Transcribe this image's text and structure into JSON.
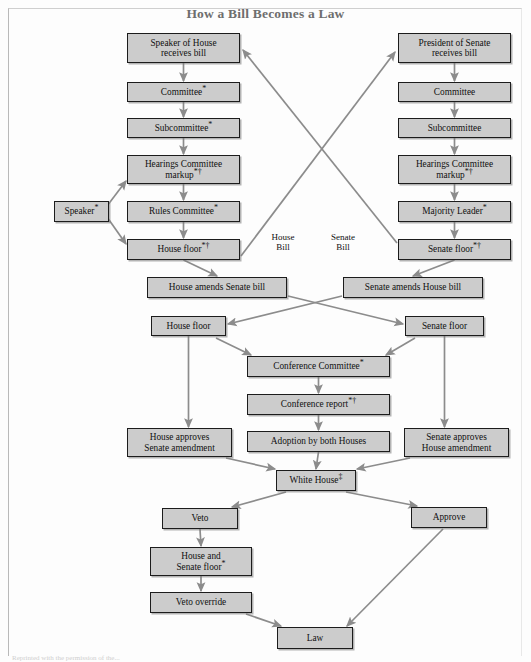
{
  "page": {
    "title": "How a Bill Becomes a Law",
    "footnote": "Reprinted with the permission of the..."
  },
  "chart_data": {
    "type": "diagram",
    "title": "How a Bill Becomes a Law",
    "subtitle": "",
    "legend": [],
    "annotations": [
      {
        "id": "house-bill-label",
        "text": "House\nBill",
        "x": 283,
        "y": 232
      },
      {
        "id": "senate-bill-label",
        "text": "Senate\nBill",
        "x": 343,
        "y": 232
      }
    ],
    "footnote_symbols": {
      "asterisk": "*",
      "dagger": "†",
      "double_dagger": "‡"
    },
    "nodes": [
      {
        "id": "speaker-of-house",
        "label": "Speaker of House\nreceives bill",
        "x": 127,
        "y": 33,
        "w": 113,
        "h": 30
      },
      {
        "id": "house-committee",
        "label": "Committee*",
        "x": 127,
        "y": 82,
        "w": 113,
        "h": 20
      },
      {
        "id": "house-subcommittee",
        "label": "Subcommittee*",
        "x": 127,
        "y": 118,
        "w": 113,
        "h": 20
      },
      {
        "id": "house-hearings-markup",
        "label": "Hearings Committee\nmarkup*†",
        "x": 127,
        "y": 155,
        "w": 113,
        "h": 29
      },
      {
        "id": "rules-committee",
        "label": "Rules Committee*",
        "x": 127,
        "y": 201,
        "w": 113,
        "h": 21
      },
      {
        "id": "speaker-side",
        "label": "Speaker*",
        "x": 54,
        "y": 201,
        "w": 55,
        "h": 21
      },
      {
        "id": "house-floor-1",
        "label": "House floor*†",
        "x": 127,
        "y": 239,
        "w": 113,
        "h": 21
      },
      {
        "id": "president-of-senate",
        "label": "President of Senate\nreceives bill",
        "x": 398,
        "y": 33,
        "w": 113,
        "h": 30
      },
      {
        "id": "senate-committee",
        "label": "Committee",
        "x": 398,
        "y": 82,
        "w": 113,
        "h": 20
      },
      {
        "id": "senate-subcommittee",
        "label": "Subcommittee",
        "x": 398,
        "y": 118,
        "w": 113,
        "h": 20
      },
      {
        "id": "senate-hearings-markup",
        "label": "Hearings Committee\nmarkup*†",
        "x": 398,
        "y": 155,
        "w": 113,
        "h": 29
      },
      {
        "id": "majority-leader",
        "label": "Majority Leader*",
        "x": 398,
        "y": 201,
        "w": 113,
        "h": 21
      },
      {
        "id": "senate-floor-1",
        "label": "Senate floor*†",
        "x": 398,
        "y": 239,
        "w": 113,
        "h": 21
      },
      {
        "id": "house-amends-senate-bill",
        "label": "House amends Senate bill",
        "x": 147,
        "y": 277,
        "w": 140,
        "h": 21
      },
      {
        "id": "senate-amends-house-bill",
        "label": "Senate amends House bill",
        "x": 343,
        "y": 277,
        "w": 140,
        "h": 21
      },
      {
        "id": "house-floor-2",
        "label": "House floor",
        "x": 151,
        "y": 316,
        "w": 75,
        "h": 20
      },
      {
        "id": "senate-floor-2",
        "label": "Senate floor",
        "x": 405,
        "y": 316,
        "w": 79,
        "h": 20
      },
      {
        "id": "conference-committee",
        "label": "Conference Committee*",
        "x": 247,
        "y": 356,
        "w": 143,
        "h": 21
      },
      {
        "id": "conference-report",
        "label": "Conference report*†",
        "x": 247,
        "y": 394,
        "w": 143,
        "h": 21
      },
      {
        "id": "house-approves-senate-amendment",
        "label": "House approves\nSenate amendment",
        "x": 127,
        "y": 428,
        "w": 105,
        "h": 29
      },
      {
        "id": "adoption-by-both-houses",
        "label": "Adoption by both Houses",
        "x": 247,
        "y": 431,
        "w": 143,
        "h": 21
      },
      {
        "id": "senate-approves-house-amendment",
        "label": "Senate approves\nHouse amendment",
        "x": 404,
        "y": 428,
        "w": 105,
        "h": 29
      },
      {
        "id": "white-house",
        "label": "White House‡",
        "x": 276,
        "y": 470,
        "w": 80,
        "h": 21
      },
      {
        "id": "veto",
        "label": "Veto",
        "x": 162,
        "y": 508,
        "w": 76,
        "h": 21
      },
      {
        "id": "approve",
        "label": "Approve",
        "x": 411,
        "y": 507,
        "w": 76,
        "h": 21
      },
      {
        "id": "house-and-senate-floor",
        "label": "House and\nSenate floor*",
        "x": 150,
        "y": 547,
        "w": 102,
        "h": 29
      },
      {
        "id": "veto-override",
        "label": "Veto override",
        "x": 150,
        "y": 592,
        "w": 102,
        "h": 21
      },
      {
        "id": "law",
        "label": "Law",
        "x": 277,
        "y": 627,
        "w": 76,
        "h": 22
      }
    ],
    "edges": [
      {
        "from": "speaker-of-house",
        "to": "house-committee",
        "type": "straight-down"
      },
      {
        "from": "house-committee",
        "to": "house-subcommittee",
        "type": "straight-down"
      },
      {
        "from": "house-subcommittee",
        "to": "house-hearings-markup",
        "type": "straight-down"
      },
      {
        "from": "house-hearings-markup",
        "to": "rules-committee",
        "type": "straight-down"
      },
      {
        "from": "rules-committee",
        "to": "house-floor-1",
        "type": "straight-down"
      },
      {
        "from": "speaker-side",
        "to": "house-hearings-markup",
        "type": "diagonal-up-right"
      },
      {
        "from": "speaker-side",
        "to": "house-floor-1",
        "type": "diagonal-down-right"
      },
      {
        "from": "house-floor-1",
        "to": "president-of-senate",
        "type": "cross-diagonal",
        "label": "House Bill"
      },
      {
        "from": "president-of-senate",
        "to": "senate-committee",
        "type": "straight-down"
      },
      {
        "from": "senate-committee",
        "to": "senate-subcommittee",
        "type": "straight-down"
      },
      {
        "from": "senate-subcommittee",
        "to": "senate-hearings-markup",
        "type": "straight-down"
      },
      {
        "from": "senate-hearings-markup",
        "to": "majority-leader",
        "type": "straight-down"
      },
      {
        "from": "majority-leader",
        "to": "senate-floor-1",
        "type": "straight-down"
      },
      {
        "from": "senate-floor-1",
        "to": "speaker-of-house",
        "type": "cross-diagonal",
        "label": "Senate Bill"
      },
      {
        "from": "house-floor-1",
        "to": "house-amends-senate-bill",
        "type": "straight-down"
      },
      {
        "from": "senate-floor-1",
        "to": "senate-amends-house-bill",
        "type": "straight-down"
      },
      {
        "from": "house-amends-senate-bill",
        "to": "senate-floor-2",
        "type": "cross-diagonal"
      },
      {
        "from": "senate-amends-house-bill",
        "to": "house-floor-2",
        "type": "cross-diagonal"
      },
      {
        "from": "house-floor-2",
        "to": "conference-committee",
        "type": "diagonal-down-right"
      },
      {
        "from": "senate-floor-2",
        "to": "conference-committee",
        "type": "diagonal-down-left"
      },
      {
        "from": "house-floor-2",
        "to": "house-approves-senate-amendment",
        "type": "straight-down"
      },
      {
        "from": "senate-floor-2",
        "to": "senate-approves-house-amendment",
        "type": "straight-down"
      },
      {
        "from": "conference-committee",
        "to": "conference-report",
        "type": "straight-down"
      },
      {
        "from": "conference-report",
        "to": "adoption-by-both-houses",
        "type": "straight-down"
      },
      {
        "from": "adoption-by-both-houses",
        "to": "white-house",
        "type": "straight-down"
      },
      {
        "from": "house-approves-senate-amendment",
        "to": "white-house",
        "type": "diagonal-down-right"
      },
      {
        "from": "senate-approves-house-amendment",
        "to": "white-house",
        "type": "diagonal-down-left"
      },
      {
        "from": "white-house",
        "to": "veto",
        "type": "diagonal-down-left"
      },
      {
        "from": "white-house",
        "to": "approve",
        "type": "diagonal-down-right"
      },
      {
        "from": "veto",
        "to": "house-and-senate-floor",
        "type": "straight-down"
      },
      {
        "from": "house-and-senate-floor",
        "to": "veto-override",
        "type": "straight-down"
      },
      {
        "from": "veto-override",
        "to": "law",
        "type": "diagonal-down-right"
      },
      {
        "from": "approve",
        "to": "law",
        "type": "diagonal-down-left"
      }
    ],
    "colors": {
      "node_fill": "#cccccc",
      "node_border": "#1c1c1c",
      "arrow": "#8c8c8c",
      "title": "#6e6e6e",
      "background": "#fdfdfd"
    }
  }
}
